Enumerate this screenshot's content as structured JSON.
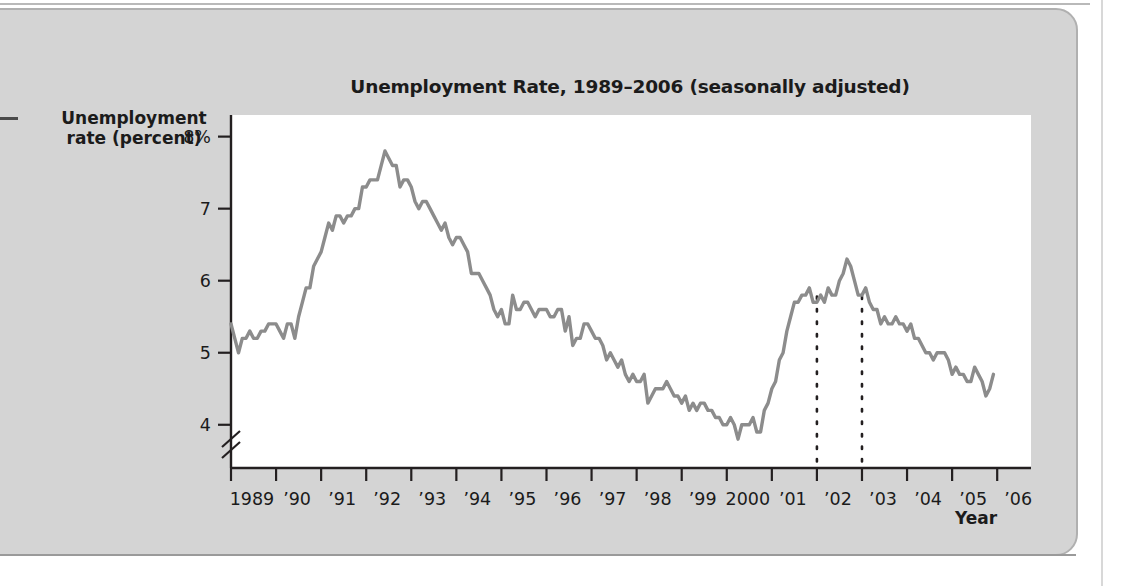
{
  "figure": {
    "title": "Unemployment Rate, 1989–2006 (seasonally adjusted)",
    "ylabel_line1": "Unemployment",
    "ylabel_line2": "rate (percent)",
    "xlabel": "Year",
    "line_color": "#8c8c8c",
    "axis_color": "#231f20",
    "panel_color": "#d4d4d4",
    "plot_bg": "#ffffff"
  },
  "chart_data": {
    "type": "line",
    "title": "Unemployment Rate, 1989–2006 (seasonally adjusted)",
    "xlabel": "Year",
    "ylabel": "Unemployment rate (percent)",
    "ylim": [
      3.4,
      8.3
    ],
    "yticks": [
      4,
      5,
      6,
      7,
      8
    ],
    "ytick_labels": [
      "4",
      "5",
      "6",
      "7",
      "8%"
    ],
    "y_axis_break": true,
    "grid": false,
    "legend": null,
    "xlim": [
      1989.0,
      2006.75
    ],
    "xticks": [
      1989,
      1990,
      1991,
      1992,
      1993,
      1994,
      1995,
      1996,
      1997,
      1998,
      1999,
      2000,
      2001,
      2002,
      2003,
      2004,
      2005,
      2006
    ],
    "xtick_labels": [
      "1989",
      "’90",
      "’91",
      "’92",
      "’93",
      "’94",
      "’95",
      "’96",
      "’97",
      "’98",
      "’99",
      "2000",
      "’01",
      "’02",
      "’03",
      "’04",
      "’05",
      "’06"
    ],
    "annotations": [
      {
        "type": "vertical-dotted-line",
        "x": 2002,
        "y_top": 5.78,
        "y_bottom": 3.4
      },
      {
        "type": "vertical-dotted-line",
        "x": 2003,
        "y_top": 5.78,
        "y_bottom": 3.4
      }
    ],
    "series": [
      {
        "name": "Unemployment rate",
        "x_start": 1989.0,
        "x_step": 0.08333,
        "values": [
          5.4,
          5.2,
          5.0,
          5.2,
          5.2,
          5.3,
          5.2,
          5.2,
          5.3,
          5.3,
          5.4,
          5.4,
          5.4,
          5.3,
          5.2,
          5.4,
          5.4,
          5.2,
          5.5,
          5.7,
          5.9,
          5.9,
          6.2,
          6.3,
          6.4,
          6.6,
          6.8,
          6.7,
          6.9,
          6.9,
          6.8,
          6.9,
          6.9,
          7.0,
          7.0,
          7.3,
          7.3,
          7.4,
          7.4,
          7.4,
          7.6,
          7.8,
          7.7,
          7.6,
          7.6,
          7.3,
          7.4,
          7.4,
          7.3,
          7.1,
          7.0,
          7.1,
          7.1,
          7.0,
          6.9,
          6.8,
          6.7,
          6.8,
          6.6,
          6.5,
          6.6,
          6.6,
          6.5,
          6.4,
          6.1,
          6.1,
          6.1,
          6.0,
          5.9,
          5.8,
          5.6,
          5.5,
          5.6,
          5.4,
          5.4,
          5.8,
          5.6,
          5.6,
          5.7,
          5.7,
          5.6,
          5.5,
          5.6,
          5.6,
          5.6,
          5.5,
          5.5,
          5.6,
          5.6,
          5.3,
          5.5,
          5.1,
          5.2,
          5.2,
          5.4,
          5.4,
          5.3,
          5.2,
          5.2,
          5.1,
          4.9,
          5.0,
          4.9,
          4.8,
          4.9,
          4.7,
          4.6,
          4.7,
          4.6,
          4.6,
          4.7,
          4.3,
          4.4,
          4.5,
          4.5,
          4.5,
          4.6,
          4.5,
          4.4,
          4.4,
          4.3,
          4.4,
          4.2,
          4.3,
          4.2,
          4.3,
          4.3,
          4.2,
          4.2,
          4.1,
          4.1,
          4.0,
          4.0,
          4.1,
          4.0,
          3.8,
          4.0,
          4.0,
          4.0,
          4.1,
          3.9,
          3.9,
          4.2,
          4.3,
          4.5,
          4.6,
          4.9,
          5.0,
          5.3,
          5.5,
          5.7,
          5.7,
          5.8,
          5.8,
          5.9,
          5.7,
          5.7,
          5.8,
          5.7,
          5.9,
          5.8,
          5.8,
          6.0,
          6.1,
          6.3,
          6.2,
          6.0,
          5.8,
          5.8,
          5.9,
          5.7,
          5.6,
          5.6,
          5.4,
          5.5,
          5.4,
          5.4,
          5.5,
          5.4,
          5.4,
          5.3,
          5.4,
          5.2,
          5.2,
          5.1,
          5.0,
          5.0,
          4.9,
          5.0,
          5.0,
          5.0,
          4.9,
          4.7,
          4.8,
          4.7,
          4.7,
          4.6,
          4.6,
          4.8,
          4.7,
          4.6,
          4.4,
          4.5,
          4.7
        ]
      }
    ]
  }
}
